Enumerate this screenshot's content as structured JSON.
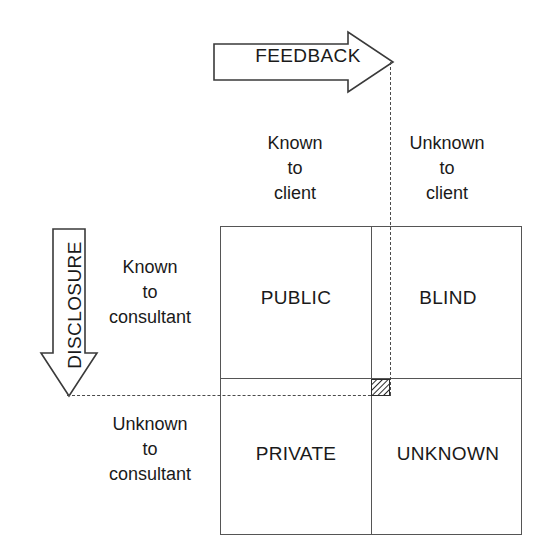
{
  "diagram": {
    "line_color": "#555555",
    "dash_color": "#4a4a4a",
    "text_color": "#1a1a1a",
    "background": "#ffffff"
  },
  "arrows": {
    "feedback": {
      "label": "FEEDBACK",
      "direction": "right",
      "icon": "right-arrow-icon"
    },
    "disclosure": {
      "label": "DISCLOSURE",
      "direction": "down",
      "icon": "down-arrow-icon"
    }
  },
  "column_headers": [
    {
      "line1": "Known",
      "line2": "to",
      "line3": "client"
    },
    {
      "line1": "Unknown",
      "line2": "to",
      "line3": "client"
    }
  ],
  "row_headers": [
    {
      "line1": "Known",
      "line2": "to",
      "line3": "consultant"
    },
    {
      "line1": "Unknown",
      "line2": "to",
      "line3": "consultant"
    }
  ],
  "quadrants": {
    "top_left": "PUBLIC",
    "top_right": "BLIND",
    "bottom_left": "PRIVATE",
    "bottom_right": "UNKNOWN"
  },
  "marker": {
    "name": "hatched-intersection-marker",
    "pattern": "diagonal-hatch"
  }
}
